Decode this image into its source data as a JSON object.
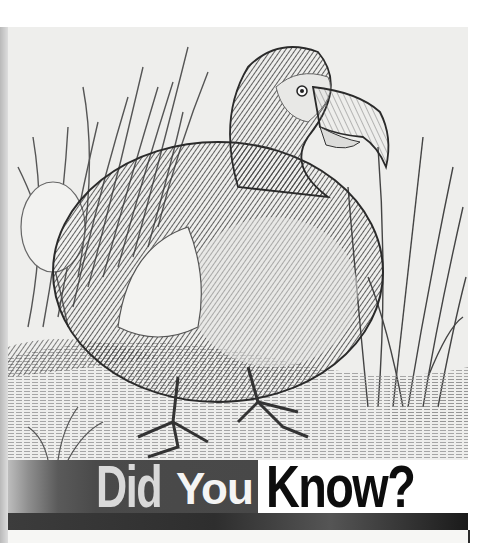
{
  "illustration": {
    "subject": "Dodo bird engraving",
    "description": "Black-and-white engraving of a dodo standing on a riverbank among tall reeds and grasses"
  },
  "banner": {
    "word_1": "Did",
    "word_2": "You",
    "word_3": "Know?"
  },
  "colors": {
    "banner_dark": "#484848",
    "did_text": "#d9d9d9",
    "you_text": "#f4f4f4",
    "know_text": "#0d0d0d",
    "bar": "#2e2e2e",
    "illustration_bg": "#eeeeec"
  }
}
